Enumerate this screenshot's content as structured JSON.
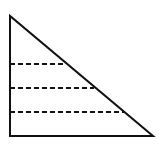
{
  "diagram": {
    "type": "right-triangle-with-horizontal-sections",
    "stroke_color": "#111111",
    "background": "#ffffff",
    "triangle": {
      "apex": [
        10,
        16
      ],
      "bottom_left": [
        10,
        136
      ],
      "bottom_right": [
        153,
        136
      ]
    },
    "dashed_lines": [
      {
        "y": 64,
        "x_start": 10,
        "x_end": 64
      },
      {
        "y": 88,
        "x_start": 10,
        "x_end": 94
      },
      {
        "y": 112,
        "x_start": 10,
        "x_end": 124
      }
    ]
  }
}
